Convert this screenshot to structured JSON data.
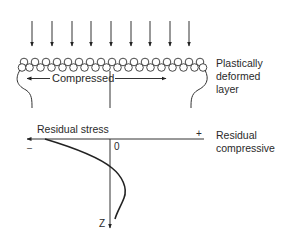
{
  "top_diagram": {
    "load_arrows_count": 9,
    "center_label": "Compressed",
    "side_label_lines": [
      "Plastically",
      "deformed",
      "layer"
    ]
  },
  "stress_plot": {
    "axis_label": "Residual stress",
    "minus_sign": "–",
    "plus_sign": "+",
    "origin_label": "0",
    "depth_axis_label": "Z",
    "side_label_lines": [
      "Residual",
      "compressive"
    ]
  },
  "colors": {
    "ink": "#222222",
    "background": "#ffffff"
  }
}
